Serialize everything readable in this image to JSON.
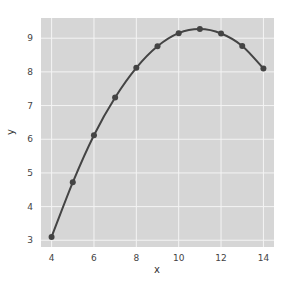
{
  "chart_data": {
    "type": "line",
    "title": "",
    "xlabel": "x",
    "ylabel": "y",
    "x": [
      4,
      5,
      6,
      7,
      8,
      9,
      10,
      11,
      12,
      13,
      14
    ],
    "series": [
      {
        "name": "y",
        "values": [
          3.1,
          4.72,
          6.12,
          7.24,
          8.12,
          8.76,
          9.15,
          9.27,
          9.14,
          8.77,
          8.1
        ],
        "color": "#444444",
        "marker": "circle"
      }
    ],
    "xticks": [
      4,
      6,
      8,
      10,
      12,
      14
    ],
    "yticks": [
      3,
      4,
      5,
      6,
      7,
      8,
      9
    ],
    "xlim": [
      3.5,
      14.5
    ],
    "ylim": [
      2.8,
      9.6
    ],
    "grid": true,
    "background": "#d6d6d6",
    "legend": null
  }
}
